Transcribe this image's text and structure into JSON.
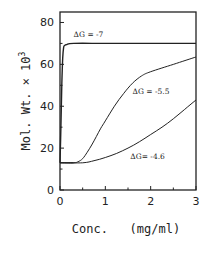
{
  "chart_data": {
    "type": "line",
    "title": "",
    "xlabel": "Conc.   (mg/ml)",
    "ylabel": "Mol. Wt. × 10",
    "ylabel_superscript": "3",
    "xlim": [
      0,
      3
    ],
    "ylim": [
      0,
      85
    ],
    "xticks": [
      0,
      1,
      2,
      3
    ],
    "xtick_labels": [
      "0",
      "1",
      "2",
      "3"
    ],
    "x_minor_ticks": [
      0.5,
      1.5,
      2.5
    ],
    "yticks": [
      0,
      20,
      40,
      60,
      80
    ],
    "ytick_labels": [
      "0",
      "20",
      "40",
      "60",
      "80"
    ],
    "y_minor_ticks": [
      10,
      30,
      50,
      70
    ],
    "grid": false,
    "legend": "none (inline annotations)",
    "series": [
      {
        "name": "ΔG = -7",
        "label": "ΔG = -7",
        "x": [
          0,
          0.02,
          0.04,
          0.06,
          0.08,
          0.1,
          0.15,
          0.3,
          1.0,
          2.0,
          3.0
        ],
        "y": [
          13,
          30,
          50,
          63,
          68,
          69,
          69.5,
          70,
          70,
          70,
          70
        ]
      },
      {
        "name": "ΔG = -5.5",
        "label": "ΔG = -5.5",
        "x": [
          0,
          0.3,
          0.4,
          0.5,
          0.6,
          0.7,
          0.8,
          0.9,
          1.0,
          1.2,
          1.4,
          1.6,
          1.8,
          2.0,
          2.5,
          3.0
        ],
        "y": [
          13,
          13,
          13.5,
          15,
          18,
          21.5,
          25.5,
          29.5,
          33,
          40,
          46,
          51,
          54.5,
          56.5,
          60,
          63.5
        ]
      },
      {
        "name": "ΔG = -4.6",
        "label": "ΔG = -4.6",
        "x": [
          0,
          0.5,
          0.75,
          1.0,
          1.25,
          1.5,
          1.75,
          2.0,
          2.25,
          2.5,
          2.75,
          3.0
        ],
        "y": [
          13,
          13,
          14,
          15.5,
          17.5,
          20,
          23,
          26.5,
          30,
          34,
          38.5,
          43
        ]
      }
    ],
    "annotations": [
      {
        "text": "ΔG = -7",
        "x": 0.3,
        "y": 73
      },
      {
        "text": "ΔG = -5.5",
        "x": 1.6,
        "y": 46
      },
      {
        "text": "ΔG= -4.6",
        "x": 1.55,
        "y": 15
      }
    ]
  }
}
